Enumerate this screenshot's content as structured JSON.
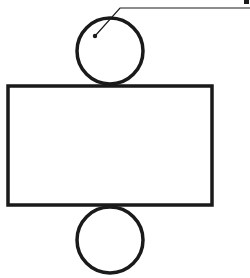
{
  "diagram": {
    "type": "cylinder-net",
    "canvas": {
      "width": 250,
      "height": 278,
      "background": "#ffffff"
    },
    "stroke_color": "#1a1a1a",
    "shapes": {
      "top_circle": {
        "cx": 110,
        "cy": 51,
        "r": 33,
        "stroke_width": 3.5
      },
      "rectangle": {
        "x": 8,
        "y": 86,
        "width": 204,
        "height": 119,
        "stroke_width": 3.5
      },
      "bottom_circle": {
        "cx": 110,
        "cy": 240,
        "r": 33,
        "stroke_width": 3.5
      },
      "center_dot": {
        "cx": 95,
        "cy": 36,
        "r": 2.2
      },
      "leader_line": {
        "points": "95,36 120,8 250,8",
        "stroke_width": 1.2
      }
    },
    "label_tick": {
      "x": 244,
      "y": 0,
      "width": 5,
      "height": 4
    }
  }
}
